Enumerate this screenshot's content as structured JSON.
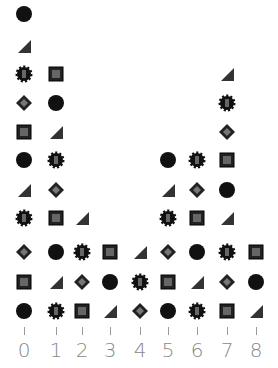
{
  "chart_data": {
    "type": "scatter",
    "title": "",
    "xlabel": "",
    "ylabel": "",
    "categories": [
      "0",
      "1",
      "2",
      "3",
      "4",
      "5",
      "6",
      "7",
      "8"
    ],
    "values": [
      11,
      9,
      4,
      3,
      3,
      6,
      6,
      9,
      3
    ],
    "grid": false,
    "legend": "none",
    "marker_style": "stacked pictograph icons (varied textured shapes)"
  },
  "axis": {
    "tick_labels": [
      "0",
      "1",
      "2",
      "3",
      "4",
      "5",
      "6",
      "7",
      "8"
    ]
  },
  "colors": {
    "marker": "#111111",
    "axis": "#999999"
  }
}
